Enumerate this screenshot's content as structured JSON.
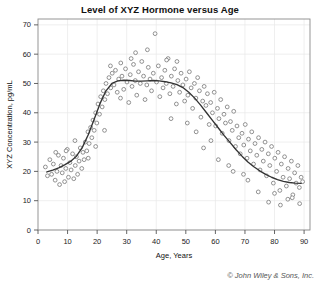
{
  "chart_data": {
    "type": "scatter",
    "title": "Level of XYZ Hormone versus Age",
    "xlabel": "Age, Years",
    "ylabel": "XYZ Concentration, pg/mL",
    "xlim": [
      0,
      92
    ],
    "ylim": [
      0,
      72
    ],
    "xticks": [
      0,
      10,
      20,
      30,
      40,
      50,
      60,
      70,
      80,
      90
    ],
    "yticks": [
      0,
      10,
      20,
      30,
      40,
      50,
      60,
      70
    ],
    "grid": true,
    "legend": "none",
    "marker": "open-circle",
    "marker_color": "#777777",
    "series": [
      {
        "name": "XYZ hormone observations",
        "points": [
          [
            2.5,
            21.5
          ],
          [
            3.2,
            18.5
          ],
          [
            4.0,
            24.0
          ],
          [
            4.6,
            19.0
          ],
          [
            5.2,
            22.5
          ],
          [
            5.8,
            17.0
          ],
          [
            6.4,
            20.0
          ],
          [
            6.9,
            25.5
          ],
          [
            7.3,
            15.5
          ],
          [
            7.8,
            22.0
          ],
          [
            8.2,
            19.5
          ],
          [
            8.6,
            24.5
          ],
          [
            9.0,
            16.5
          ],
          [
            9.4,
            21.0
          ],
          [
            9.9,
            27.5
          ],
          [
            10.3,
            18.0
          ],
          [
            10.8,
            23.0
          ],
          [
            11.2,
            20.5
          ],
          [
            11.7,
            26.0
          ],
          [
            12.1,
            17.5
          ],
          [
            12.6,
            22.0
          ],
          [
            13.0,
            25.0
          ],
          [
            13.4,
            19.0
          ],
          [
            13.9,
            23.5
          ],
          [
            14.3,
            28.0
          ],
          [
            14.8,
            21.0
          ],
          [
            15.2,
            26.5
          ],
          [
            15.6,
            24.0
          ],
          [
            16.0,
            30.0
          ],
          [
            16.5,
            27.0
          ],
          [
            16.9,
            33.5
          ],
          [
            17.3,
            29.5
          ],
          [
            17.8,
            35.0
          ],
          [
            18.2,
            31.5
          ],
          [
            18.6,
            37.5
          ],
          [
            19.0,
            34.0
          ],
          [
            19.5,
            40.0
          ],
          [
            19.9,
            36.5
          ],
          [
            20.3,
            43.0
          ],
          [
            20.8,
            39.5
          ],
          [
            21.2,
            45.5
          ],
          [
            21.7,
            42.0
          ],
          [
            22.1,
            47.5
          ],
          [
            22.6,
            44.5
          ],
          [
            23.0,
            50.0
          ],
          [
            23.5,
            46.5
          ],
          [
            24.0,
            52.0
          ],
          [
            24.6,
            48.5
          ],
          [
            25.1,
            53.5
          ],
          [
            25.7,
            49.5
          ],
          [
            26.2,
            54.5
          ],
          [
            26.8,
            47.0
          ],
          [
            27.3,
            51.5
          ],
          [
            27.9,
            45.0
          ],
          [
            28.4,
            52.5
          ],
          [
            29.0,
            48.0
          ],
          [
            29.6,
            55.0
          ],
          [
            30.1,
            50.5
          ],
          [
            30.7,
            43.5
          ],
          [
            31.2,
            53.0
          ],
          [
            31.8,
            49.0
          ],
          [
            32.3,
            56.5
          ],
          [
            32.9,
            51.0
          ],
          [
            33.4,
            46.0
          ],
          [
            34.0,
            54.0
          ],
          [
            34.6,
            50.0
          ],
          [
            35.1,
            57.5
          ],
          [
            35.7,
            52.5
          ],
          [
            36.2,
            44.5
          ],
          [
            36.8,
            49.5
          ],
          [
            37.3,
            55.5
          ],
          [
            37.9,
            51.5
          ],
          [
            38.4,
            47.5
          ],
          [
            39.0,
            53.5
          ],
          [
            39.6,
            67.0
          ],
          [
            40.1,
            50.5
          ],
          [
            40.7,
            56.0
          ],
          [
            41.2,
            45.5
          ],
          [
            41.8,
            52.0
          ],
          [
            42.3,
            48.5
          ],
          [
            42.9,
            54.5
          ],
          [
            43.4,
            50.0
          ],
          [
            44.0,
            58.5
          ],
          [
            44.6,
            46.5
          ],
          [
            45.1,
            52.5
          ],
          [
            45.7,
            49.0
          ],
          [
            46.2,
            55.0
          ],
          [
            46.8,
            43.0
          ],
          [
            47.3,
            51.0
          ],
          [
            47.9,
            47.0
          ],
          [
            48.4,
            53.5
          ],
          [
            49.0,
            49.5
          ],
          [
            49.6,
            44.0
          ],
          [
            50.1,
            51.5
          ],
          [
            50.7,
            46.0
          ],
          [
            51.2,
            54.0
          ],
          [
            51.8,
            48.5
          ],
          [
            52.3,
            41.5
          ],
          [
            52.9,
            50.0
          ],
          [
            53.4,
            45.0
          ],
          [
            54.0,
            52.0
          ],
          [
            54.6,
            47.5
          ],
          [
            55.1,
            38.5
          ],
          [
            55.7,
            44.0
          ],
          [
            56.2,
            49.0
          ],
          [
            56.8,
            42.5
          ],
          [
            57.3,
            46.5
          ],
          [
            57.9,
            36.0
          ],
          [
            58.4,
            43.5
          ],
          [
            59.0,
            40.0
          ],
          [
            59.6,
            47.0
          ],
          [
            60.1,
            35.5
          ],
          [
            60.7,
            41.5
          ],
          [
            61.2,
            38.0
          ],
          [
            61.8,
            44.5
          ],
          [
            62.3,
            33.0
          ],
          [
            62.9,
            39.5
          ],
          [
            63.4,
            36.5
          ],
          [
            64.0,
            42.0
          ],
          [
            64.6,
            30.5
          ],
          [
            65.1,
            37.0
          ],
          [
            65.7,
            34.0
          ],
          [
            66.2,
            40.5
          ],
          [
            66.8,
            28.5
          ],
          [
            67.3,
            35.5
          ],
          [
            67.9,
            31.5
          ],
          [
            68.4,
            26.0
          ],
          [
            69.0,
            33.0
          ],
          [
            69.6,
            29.0
          ],
          [
            70.1,
            36.0
          ],
          [
            70.7,
            24.5
          ],
          [
            71.2,
            31.0
          ],
          [
            71.8,
            27.0
          ],
          [
            72.3,
            33.5
          ],
          [
            72.9,
            22.5
          ],
          [
            73.4,
            29.5
          ],
          [
            74.0,
            25.5
          ],
          [
            74.6,
            31.5
          ],
          [
            75.1,
            20.5
          ],
          [
            75.7,
            27.5
          ],
          [
            76.2,
            23.5
          ],
          [
            76.8,
            30.0
          ],
          [
            77.3,
            18.5
          ],
          [
            77.9,
            26.0
          ],
          [
            78.4,
            22.0
          ],
          [
            79.0,
            28.5
          ],
          [
            79.6,
            16.0
          ],
          [
            80.1,
            24.5
          ],
          [
            80.7,
            20.0
          ],
          [
            81.2,
            26.5
          ],
          [
            81.8,
            13.5
          ],
          [
            82.3,
            22.5
          ],
          [
            82.9,
            18.0
          ],
          [
            83.4,
            25.0
          ],
          [
            84.0,
            15.0
          ],
          [
            84.6,
            21.0
          ],
          [
            85.1,
            17.5
          ],
          [
            85.7,
            23.5
          ],
          [
            86.2,
            12.0
          ],
          [
            86.8,
            19.5
          ],
          [
            87.3,
            16.0
          ],
          [
            87.9,
            22.0
          ],
          [
            88.4,
            14.5
          ],
          [
            89.0,
            18.0
          ],
          [
            89.5,
            16.5
          ],
          [
            33.0,
            60.5
          ],
          [
            37.0,
            61.5
          ],
          [
            43.5,
            58.0
          ],
          [
            47.0,
            57.5
          ],
          [
            28.0,
            57.0
          ],
          [
            31.5,
            58.5
          ],
          [
            24.5,
            56.0
          ],
          [
            22.5,
            34.0
          ],
          [
            19.5,
            28.5
          ],
          [
            17.0,
            24.5
          ],
          [
            12.5,
            30.5
          ],
          [
            9.5,
            27.0
          ],
          [
            6.0,
            26.5
          ],
          [
            78.0,
            9.5
          ],
          [
            82.0,
            8.5
          ],
          [
            84.5,
            10.5
          ],
          [
            88.5,
            9.0
          ],
          [
            71.0,
            17.0
          ],
          [
            66.0,
            20.0
          ],
          [
            61.0,
            24.0
          ],
          [
            56.0,
            28.0
          ],
          [
            58.5,
            30.5
          ],
          [
            64.5,
            22.0
          ],
          [
            69.5,
            19.0
          ],
          [
            74.5,
            13.0
          ],
          [
            80.0,
            12.5
          ],
          [
            86.0,
            11.0
          ],
          [
            53.5,
            33.5
          ],
          [
            50.5,
            36.5
          ],
          [
            45.0,
            38.0
          ]
        ]
      }
    ],
    "trend_curve": {
      "name": "lowess smoother",
      "color": "#333333",
      "points": [
        [
          3.0,
          19.8
        ],
        [
          5.0,
          20.4
        ],
        [
          7.0,
          21.2
        ],
        [
          9.0,
          22.2
        ],
        [
          11.0,
          23.4
        ],
        [
          13.0,
          25.2
        ],
        [
          15.0,
          28.2
        ],
        [
          17.0,
          32.5
        ],
        [
          19.0,
          37.8
        ],
        [
          21.0,
          43.2
        ],
        [
          23.0,
          47.5
        ],
        [
          25.0,
          50.0
        ],
        [
          27.0,
          50.9
        ],
        [
          29.0,
          51.1
        ],
        [
          31.0,
          51.0
        ],
        [
          33.0,
          50.8
        ],
        [
          35.0,
          50.8
        ],
        [
          37.0,
          50.9
        ],
        [
          39.0,
          51.0
        ],
        [
          41.0,
          50.9
        ],
        [
          43.0,
          50.6
        ],
        [
          45.0,
          50.2
        ],
        [
          47.0,
          49.6
        ],
        [
          49.0,
          48.6
        ],
        [
          51.0,
          47.0
        ],
        [
          53.0,
          45.0
        ],
        [
          55.0,
          42.6
        ],
        [
          57.0,
          40.0
        ],
        [
          59.0,
          37.4
        ],
        [
          61.0,
          34.8
        ],
        [
          63.0,
          32.2
        ],
        [
          65.0,
          29.8
        ],
        [
          67.0,
          27.4
        ],
        [
          69.0,
          25.2
        ],
        [
          71.0,
          23.2
        ],
        [
          73.0,
          21.6
        ],
        [
          75.0,
          20.2
        ],
        [
          77.0,
          19.0
        ],
        [
          79.0,
          18.0
        ],
        [
          81.0,
          17.2
        ],
        [
          83.0,
          16.6
        ],
        [
          85.0,
          16.2
        ],
        [
          87.0,
          16.0
        ],
        [
          89.0,
          15.9
        ]
      ]
    }
  },
  "footer": {
    "copyright": "© John Wiley & Sons, Inc."
  }
}
